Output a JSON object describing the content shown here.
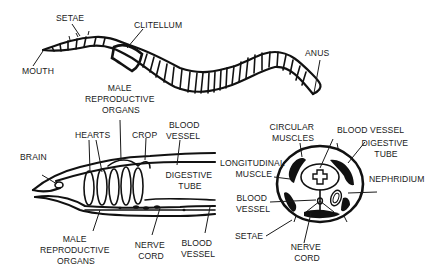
{
  "colors": {
    "ink": "#111111",
    "background": "#ffffff"
  },
  "external_view": {
    "labels": {
      "setae": "SETAE",
      "clitellum": "CLITELLUM",
      "mouth": "MOUTH",
      "anus": "ANUS"
    }
  },
  "longitudinal_section": {
    "labels": {
      "male_repro_top": [
        "MALE",
        "REPRODUCTIVE",
        "ORGANS"
      ],
      "hearts": "HEARTS",
      "crop": "CROP",
      "blood_vessel_top": [
        "BLOOD",
        "VESSEL"
      ],
      "brain": "BRAIN",
      "digestive_tube": [
        "DIGESTIVE",
        "TUBE"
      ],
      "male_repro_bottom": [
        "MALE",
        "REPRODUCTIVE",
        "ORGANS"
      ],
      "nerve_cord": [
        "NERVE",
        "CORD"
      ],
      "blood_vessel_bottom": [
        "BLOOD",
        "VESSEL"
      ]
    }
  },
  "cross_section": {
    "labels": {
      "circular_muscles": [
        "CIRCULAR",
        "MUSCLES"
      ],
      "blood_vessel_top": "BLOOD VESSEL",
      "digestive_tube": [
        "DIGESTIVE",
        "TUBE"
      ],
      "longitudinal_muscle": [
        "LONGITUDINAL",
        "MUSCLE"
      ],
      "nephridium": "NEPHRIDIUM",
      "blood_vessel_left": [
        "BLOOD",
        "VESSEL"
      ],
      "setae": "SETAE",
      "nerve_cord": [
        "NERVE",
        "CORD"
      ]
    }
  }
}
